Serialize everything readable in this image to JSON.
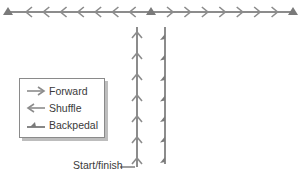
{
  "diagram": {
    "type": "drill-layout",
    "colors": {
      "line": "#8c8c8c",
      "cone": "#7a7a7a",
      "text": "#3a3a3a",
      "border": "#8a8a8a",
      "shadow": "#bdbdbd"
    },
    "top_line": {
      "y": 12,
      "x_start": 8,
      "x_end": 293,
      "cones_x": [
        8,
        151,
        293
      ],
      "left_segment": {
        "movement": "Shuffle",
        "direction": "left",
        "chevron_count": 7
      },
      "right_segment": {
        "movement": "Forward",
        "direction": "right",
        "chevron_count": 7
      }
    },
    "vertical_lines": [
      {
        "x": 137,
        "y_top": 27,
        "y_bottom": 167,
        "movement": "Forward",
        "direction": "up",
        "chevron_count": 7
      },
      {
        "x": 165,
        "y_top": 27,
        "y_bottom": 164,
        "movement": "Backpedal",
        "direction": "up",
        "barb_count": 7
      }
    ],
    "start_finish": {
      "label": "Start/finish"
    }
  },
  "legend": {
    "items": [
      {
        "icon": "forward-arrow-icon",
        "label": "Forward"
      },
      {
        "icon": "shuffle-arrow-icon",
        "label": "Shuffle"
      },
      {
        "icon": "backpedal-barb-icon",
        "label": "Backpedal"
      }
    ]
  }
}
